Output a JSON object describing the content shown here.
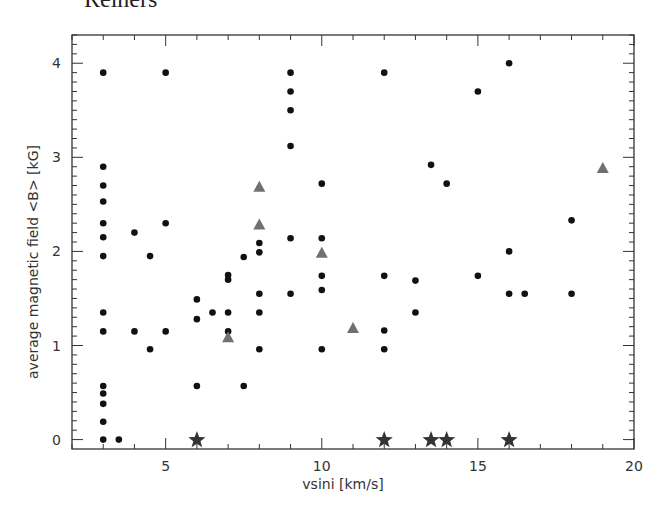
{
  "header": {
    "running_title": "Reiners"
  },
  "chart_data": {
    "type": "scatter",
    "title": "",
    "xlabel": "vsini [km/s]",
    "ylabel": "average magnetic field <B> [kG]",
    "xlim": [
      2,
      20
    ],
    "ylim": [
      -0.1,
      4.3
    ],
    "xticks": [
      5,
      10,
      15,
      20
    ],
    "xtick_labels": [
      "5",
      "10",
      "15",
      "20"
    ],
    "x_minor_step": 1,
    "yticks": [
      0,
      1,
      2,
      3,
      4
    ],
    "ytick_labels": [
      "0",
      "1",
      "2",
      "3",
      "4"
    ],
    "y_minor_step": 0.1,
    "grid": false,
    "legend": null,
    "colors": {
      "circles": "#111111",
      "triangles": "#707070",
      "stars": "#333333",
      "axes": "#333333"
    },
    "series": [
      {
        "name": "circles",
        "marker": "circle",
        "points": [
          [
            3,
            3.9
          ],
          [
            3,
            2.9
          ],
          [
            3,
            2.7
          ],
          [
            3,
            2.53
          ],
          [
            3,
            2.3
          ],
          [
            3,
            2.15
          ],
          [
            3,
            1.95
          ],
          [
            3,
            1.35
          ],
          [
            3,
            1.15
          ],
          [
            3,
            0.57
          ],
          [
            3,
            0.49
          ],
          [
            3,
            0.38
          ],
          [
            3,
            0.19
          ],
          [
            3,
            0.0
          ],
          [
            3.5,
            0.0
          ],
          [
            4,
            2.2
          ],
          [
            4,
            1.15
          ],
          [
            4.5,
            1.95
          ],
          [
            4.5,
            0.96
          ],
          [
            5,
            3.9
          ],
          [
            5,
            2.3
          ],
          [
            5,
            1.15
          ],
          [
            6,
            1.49
          ],
          [
            6,
            1.28
          ],
          [
            6,
            0.57
          ],
          [
            6.5,
            1.35
          ],
          [
            7,
            1.75
          ],
          [
            7,
            1.7
          ],
          [
            7,
            1.35
          ],
          [
            7,
            1.15
          ],
          [
            7.5,
            1.94
          ],
          [
            7.5,
            0.57
          ],
          [
            8,
            2.09
          ],
          [
            8,
            1.99
          ],
          [
            8,
            1.55
          ],
          [
            8,
            1.35
          ],
          [
            8,
            0.96
          ],
          [
            9,
            3.9
          ],
          [
            9,
            3.7
          ],
          [
            9,
            3.5
          ],
          [
            9,
            3.12
          ],
          [
            9,
            2.14
          ],
          [
            9,
            1.55
          ],
          [
            10,
            2.72
          ],
          [
            10,
            2.14
          ],
          [
            10,
            1.74
          ],
          [
            10,
            1.59
          ],
          [
            10,
            0.96
          ],
          [
            12,
            3.9
          ],
          [
            12,
            1.74
          ],
          [
            12,
            1.16
          ],
          [
            12,
            0.96
          ],
          [
            13,
            1.69
          ],
          [
            13,
            1.35
          ],
          [
            13.5,
            2.92
          ],
          [
            14,
            2.72
          ],
          [
            15,
            3.7
          ],
          [
            15,
            1.74
          ],
          [
            16,
            4.0
          ],
          [
            16,
            2.0
          ],
          [
            16,
            1.55
          ],
          [
            16.5,
            1.55
          ],
          [
            18,
            2.33
          ],
          [
            18,
            1.55
          ]
        ]
      },
      {
        "name": "triangles",
        "marker": "triangle",
        "points": [
          [
            7,
            1.08
          ],
          [
            8,
            2.68
          ],
          [
            8,
            2.28
          ],
          [
            10,
            1.98
          ],
          [
            11,
            1.18
          ],
          [
            19,
            2.88
          ]
        ]
      },
      {
        "name": "stars",
        "marker": "star",
        "points": [
          [
            6,
            0.0
          ],
          [
            12,
            0.0
          ],
          [
            13.5,
            0.0
          ],
          [
            14,
            0.0
          ],
          [
            16,
            0.0
          ]
        ]
      }
    ]
  }
}
